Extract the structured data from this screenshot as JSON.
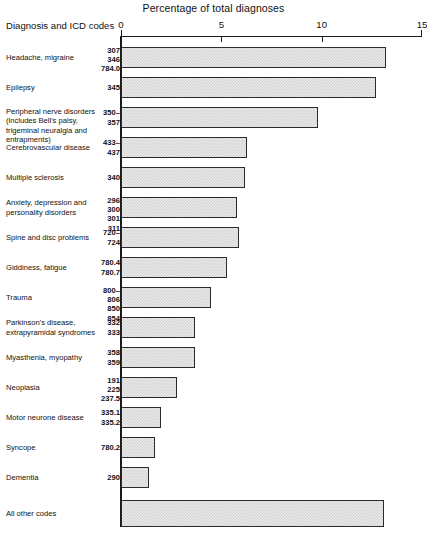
{
  "header": {
    "axis_title": "Percentage of total diagnoses",
    "corner_label": "Diagnosis and ICD codes"
  },
  "chart_data": {
    "type": "bar",
    "orientation": "horizontal",
    "title": "Percentage of total diagnoses",
    "xlabel": "Percentage of total diagnoses",
    "ylabel": "Diagnosis and ICD codes",
    "xlim": [
      0,
      15
    ],
    "ticks": [
      0,
      5,
      10,
      15
    ],
    "tick_labels": [
      "0",
      "5",
      "10",
      "15"
    ],
    "grid": false,
    "legend": false,
    "categories": [
      "Headache, migraine",
      "Epilepsy",
      "Peripheral nerve disorders (includes Bell's palsy, trigeminal neuralgia and entrapments)",
      "Cerebrovascular disease",
      "Multiple sclerosis",
      "Anxiety, depression and personality disorders",
      "Spine and disc problems",
      "Giddiness, fatigue",
      "Trauma",
      "Parkinson's disease, extrapyramidal syndromes",
      "Myasthenia, myopathy",
      "Neoplasia",
      "Motor neurone disease",
      "Syncope",
      "Dementia",
      "All other codes"
    ],
    "values": [
      13.2,
      12.7,
      9.8,
      6.3,
      6.2,
      5.8,
      5.9,
      5.3,
      4.5,
      3.7,
      3.7,
      2.8,
      2.0,
      1.7,
      1.4,
      13.1
    ],
    "icd_codes": [
      "307\n346\n784.0",
      "345",
      "350–\n357",
      "433–\n437",
      "340",
      "296\n300\n301\n311",
      "720–\n724",
      "780.4\n780.7",
      "800–\n806\n850\n854",
      "332\n333",
      "358\n359",
      "191\n225\n237.5",
      "335.1\n335.2",
      "780.2",
      "290",
      ""
    ]
  },
  "rows": [
    {
      "name": "Headache, migraine",
      "codes": "307\n346\n784.0",
      "value": 13.2
    },
    {
      "name": "Epilepsy",
      "codes": "345",
      "value": 12.7
    },
    {
      "name": "Peripheral nerve disorders (includes Bell's palsy, trigeminal neuralgia and entrapments)",
      "codes": "350–\n357",
      "value": 9.8
    },
    {
      "name": "Cerebrovascular disease",
      "codes": "433–\n437",
      "value": 6.3
    },
    {
      "name": "Multiple sclerosis",
      "codes": "340",
      "value": 6.2
    },
    {
      "name": "Anxiety, depression and personality disorders",
      "codes": "296\n300\n301\n311",
      "value": 5.8
    },
    {
      "name": "Spine and disc problems",
      "codes": "720–\n724",
      "value": 5.9
    },
    {
      "name": "Giddiness, fatigue",
      "codes": "780.4\n780.7",
      "value": 5.3
    },
    {
      "name": "Trauma",
      "codes": "800–\n806\n850\n854",
      "value": 4.5
    },
    {
      "name": "Parkinson's disease, extrapyramidal syndromes",
      "codes": "332\n333",
      "value": 3.7
    },
    {
      "name": "Myasthenia, myopathy",
      "codes": "358\n359",
      "value": 3.7
    },
    {
      "name": "Neoplasia",
      "codes": "191\n225\n237.5",
      "value": 2.8
    },
    {
      "name": "Motor neurone disease",
      "codes": "335.1\n335.2",
      "value": 2.0
    },
    {
      "name": "Syncope",
      "codes": "780.2",
      "value": 1.7
    },
    {
      "name": "Dementia",
      "codes": "290",
      "value": 1.4
    },
    {
      "name": "All other codes",
      "codes": "",
      "value": 13.1
    }
  ],
  "colors": {
    "bar_fill": "#ebebeb",
    "bar_pattern": "#cfcfcf",
    "bar_stroke": "#2b2b2b",
    "axis": "#1a1a1a",
    "text": "#111111"
  }
}
